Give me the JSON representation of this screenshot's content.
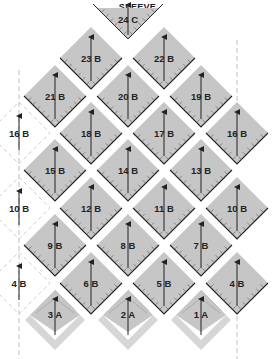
{
  "title": "SLEEVE",
  "colors": {
    "fill": "#c6c6c6",
    "edge": "#222222",
    "dashed": "#bdbdbd",
    "light": "#d6d6d6"
  },
  "pieces": [
    {
      "num": "24",
      "type": "C",
      "cx": 128,
      "cy": 20,
      "shape": "triangle"
    },
    {
      "num": "23",
      "type": "B",
      "cx": 91,
      "cy": 58
    },
    {
      "num": "22",
      "type": "B",
      "cx": 164,
      "cy": 58
    },
    {
      "num": "21",
      "type": "B",
      "cx": 55,
      "cy": 96
    },
    {
      "num": "20",
      "type": "B",
      "cx": 128,
      "cy": 96
    },
    {
      "num": "19",
      "type": "B",
      "cx": 201,
      "cy": 96
    },
    {
      "num": "18",
      "type": "B",
      "cx": 91,
      "cy": 133
    },
    {
      "num": "17",
      "type": "B",
      "cx": 164,
      "cy": 133
    },
    {
      "num": "16",
      "type": "B",
      "cx": 237,
      "cy": 133
    },
    {
      "num": "15",
      "type": "B",
      "cx": 55,
      "cy": 170
    },
    {
      "num": "14",
      "type": "B",
      "cx": 128,
      "cy": 170
    },
    {
      "num": "13",
      "type": "B",
      "cx": 201,
      "cy": 170
    },
    {
      "num": "12",
      "type": "B",
      "cx": 91,
      "cy": 208
    },
    {
      "num": "11",
      "type": "B",
      "cx": 164,
      "cy": 208
    },
    {
      "num": "10",
      "type": "B",
      "cx": 237,
      "cy": 208
    },
    {
      "num": "9",
      "type": "B",
      "cx": 55,
      "cy": 245
    },
    {
      "num": "8",
      "type": "B",
      "cx": 128,
      "cy": 245
    },
    {
      "num": "7",
      "type": "B",
      "cx": 201,
      "cy": 245
    },
    {
      "num": "6",
      "type": "B",
      "cx": 91,
      "cy": 283
    },
    {
      "num": "5",
      "type": "B",
      "cx": 164,
      "cy": 283
    },
    {
      "num": "4",
      "type": "B",
      "cx": 237,
      "cy": 283
    },
    {
      "num": "3",
      "type": "A",
      "cx": 55,
      "cy": 315,
      "shape": "a"
    },
    {
      "num": "2",
      "type": "A",
      "cx": 128,
      "cy": 315,
      "shape": "a"
    },
    {
      "num": "1",
      "type": "A",
      "cx": 201,
      "cy": 315,
      "shape": "a"
    }
  ],
  "ghost_pieces": [
    {
      "num": "16",
      "type": "B",
      "cx": 19,
      "cy": 133
    },
    {
      "num": "10",
      "type": "B",
      "cx": 19,
      "cy": 208
    },
    {
      "num": "4",
      "type": "B",
      "cx": 19,
      "cy": 283
    }
  ]
}
